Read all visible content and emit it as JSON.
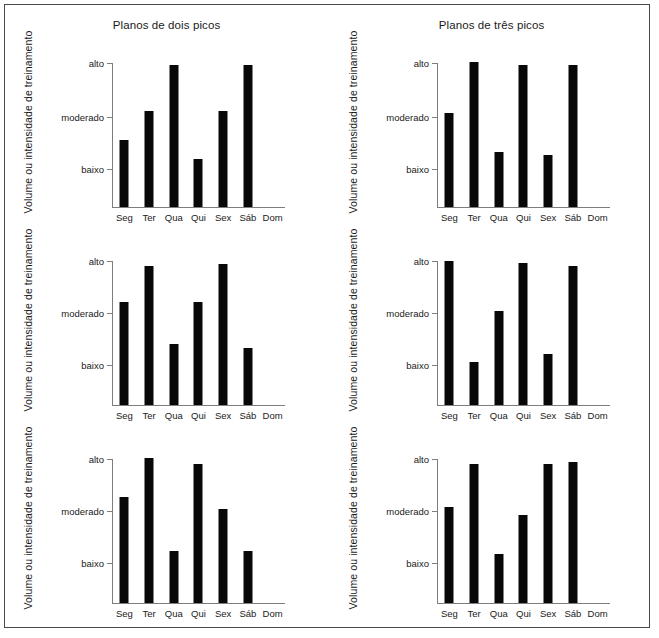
{
  "figure": {
    "background": "#ffffff",
    "border_color": "#4a4a4a",
    "bar_color": "#080808",
    "axis_color": "#7d7d7d",
    "columns": [
      {
        "title": "Planos de dois picos"
      },
      {
        "title": "Planos de três picos"
      }
    ]
  },
  "axis": {
    "ylabel": "Volume ou intensidade de treinamento",
    "ytick_labels": [
      "alto",
      "moderado",
      "baixo"
    ],
    "xtick_labels": [
      "Seg",
      "Ter",
      "Qua",
      "Qui",
      "Sex",
      "Sáb",
      "Dom"
    ]
  },
  "chart_data": [
    {
      "type": "bar",
      "title": "Planos de dois picos",
      "subtitle": "semana 1",
      "xlabel": "",
      "ylabel": "Volume ou intensidade de treinamento",
      "categories": [
        "Seg",
        "Ter",
        "Qua",
        "Qui",
        "Sex",
        "Sáb",
        "Dom"
      ],
      "values": [
        0.46,
        0.66,
        0.98,
        0.33,
        0.66,
        0.98,
        0
      ],
      "ylim": [
        0,
        1
      ],
      "ytick_labels": [
        "baixo",
        "moderado",
        "alto"
      ],
      "ytick_values": [
        0.27,
        0.63,
        1.0
      ],
      "grid": false,
      "legend": "none"
    },
    {
      "type": "bar",
      "title": "Planos de três picos",
      "subtitle": "semana 1",
      "xlabel": "",
      "ylabel": "Volume ou intensidade de treinamento",
      "categories": [
        "Seg",
        "Ter",
        "Qua",
        "Qui",
        "Sex",
        "Sáb",
        "Dom"
      ],
      "values": [
        0.65,
        1.0,
        0.38,
        0.98,
        0.36,
        0.98,
        0
      ],
      "ylim": [
        0,
        1
      ],
      "ytick_labels": [
        "baixo",
        "moderado",
        "alto"
      ],
      "ytick_values": [
        0.27,
        0.63,
        1.0
      ],
      "grid": false,
      "legend": "none"
    },
    {
      "type": "bar",
      "title": "Planos de dois picos",
      "subtitle": "semana 2",
      "xlabel": "",
      "ylabel": "Volume ou intensidade de treinamento",
      "categories": [
        "Seg",
        "Ter",
        "Qua",
        "Qui",
        "Sex",
        "Sáb",
        "Dom"
      ],
      "values": [
        0.71,
        0.96,
        0.42,
        0.71,
        0.97,
        0.39,
        0
      ],
      "ylim": [
        0,
        1
      ],
      "ytick_labels": [
        "baixo",
        "moderado",
        "alto"
      ],
      "ytick_values": [
        0.28,
        0.64,
        1.0
      ],
      "grid": false,
      "legend": "none"
    },
    {
      "type": "bar",
      "title": "Planos de três picos",
      "subtitle": "semana 2",
      "xlabel": "",
      "ylabel": "Volume ou intensidade de treinamento",
      "categories": [
        "Seg",
        "Ter",
        "Qua",
        "Qui",
        "Sex",
        "Sáb",
        "Dom"
      ],
      "values": [
        0.99,
        0.3,
        0.65,
        0.98,
        0.35,
        0.96,
        0
      ],
      "ylim": [
        0,
        1
      ],
      "ytick_labels": [
        "baixo",
        "moderado",
        "alto"
      ],
      "ytick_values": [
        0.28,
        0.64,
        1.0
      ],
      "grid": false,
      "legend": "none"
    },
    {
      "type": "bar",
      "title": "Planos de dois picos",
      "subtitle": "semana 3",
      "xlabel": "",
      "ylabel": "Volume ou intensidade de treinamento",
      "categories": [
        "Seg",
        "Ter",
        "Qua",
        "Qui",
        "Sex",
        "Sáb",
        "Dom"
      ],
      "values": [
        0.73,
        1.0,
        0.36,
        0.96,
        0.65,
        0.36,
        0
      ],
      "ylim": [
        0,
        1
      ],
      "ytick_labels": [
        "baixo",
        "moderado",
        "alto"
      ],
      "ytick_values": [
        0.28,
        0.64,
        1.0
      ],
      "grid": false,
      "legend": "none"
    },
    {
      "type": "bar",
      "title": "Planos de três picos",
      "subtitle": "semana 3",
      "xlabel": "",
      "ylabel": "Volume ou intensidade de treinamento",
      "categories": [
        "Seg",
        "Ter",
        "Qua",
        "Qui",
        "Sex",
        "Sáb",
        "Dom"
      ],
      "values": [
        0.66,
        0.96,
        0.34,
        0.61,
        0.96,
        0.97,
        0
      ],
      "ylim": [
        0,
        1
      ],
      "ytick_labels": [
        "baixo",
        "moderado",
        "alto"
      ],
      "ytick_values": [
        0.28,
        0.64,
        1.0
      ],
      "grid": false,
      "legend": "none"
    }
  ]
}
